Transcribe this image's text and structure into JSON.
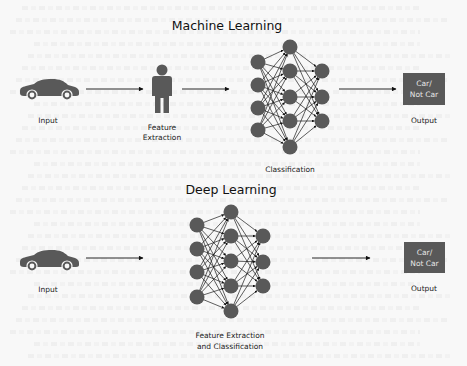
{
  "colors": {
    "background": "#f8f8f8",
    "node": "#595959",
    "edge": "#1a1a1a",
    "output_box": "#595959",
    "output_text": "#e6e6e6"
  },
  "machine_learning": {
    "title": "Machine Learning",
    "input_label": "Input",
    "feature_label_line1": "Feature",
    "feature_label_line2": "Extraction",
    "network_label": "Classification",
    "output_box_line1": "Car/",
    "output_box_line2": "Not Car",
    "output_label": "Output",
    "icons": [
      "car-icon",
      "person-icon",
      "neural-network-icon"
    ],
    "network_layers": [
      4,
      5,
      3
    ]
  },
  "deep_learning": {
    "title": "Deep Learning",
    "input_label": "Input",
    "network_label_line1": "Feature Extraction",
    "network_label_line2": "and Classification",
    "output_box_line1": "Car/",
    "output_box_line2": "Not Car",
    "output_label": "Output",
    "icons": [
      "car-icon",
      "neural-network-icon"
    ],
    "network_layers": [
      4,
      5,
      3
    ]
  }
}
